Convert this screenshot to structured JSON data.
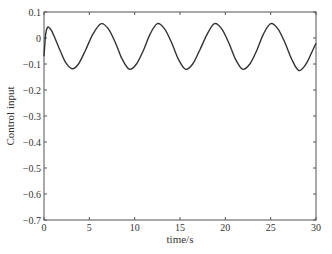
{
  "chart_data": {
    "type": "line",
    "title": "",
    "xlabel": "time/s",
    "ylabel": "Control input",
    "xlim": [
      0,
      30
    ],
    "ylim": [
      -0.7,
      0.1
    ],
    "xticks": [
      0,
      5,
      10,
      15,
      20,
      25,
      30
    ],
    "yticks": [
      0.1,
      0,
      -0.1,
      -0.2,
      -0.3,
      -0.4,
      -0.5,
      -0.6,
      -0.7
    ],
    "xtick_labels": [
      "0",
      "5",
      "10",
      "15",
      "20",
      "25",
      "30"
    ],
    "ytick_labels": [
      "0.1",
      "0",
      "-0.1",
      "-0.2",
      "-0.3",
      "-0.4",
      "-0.5",
      "-0.6",
      "-0.7"
    ],
    "grid": false,
    "legend": null,
    "series": [
      {
        "name": "Control input",
        "color": "#333333",
        "x": [
          0,
          0.1,
          0.2,
          0.35,
          0.5,
          0.8,
          1.2,
          1.8,
          2.4,
          3.1,
          3.8,
          4.6,
          5.4,
          6.3,
          7.1,
          7.9,
          8.6,
          9.4,
          10.2,
          11.0,
          11.7,
          12.5,
          13.3,
          14.1,
          14.8,
          15.6,
          16.4,
          17.2,
          18.0,
          18.8,
          19.6,
          20.4,
          21.1,
          21.9,
          22.7,
          23.5,
          24.2,
          25.0,
          25.8,
          26.6,
          27.3,
          28.1,
          28.9,
          29.6,
          30.0
        ],
        "y": [
          -0.07,
          -0.02,
          0.02,
          0.038,
          0.042,
          0.03,
          0.0,
          -0.05,
          -0.095,
          -0.118,
          -0.1,
          -0.045,
          0.015,
          0.055,
          0.035,
          -0.02,
          -0.08,
          -0.12,
          -0.1,
          -0.045,
          0.015,
          0.055,
          0.035,
          -0.02,
          -0.08,
          -0.12,
          -0.1,
          -0.045,
          0.015,
          0.055,
          0.035,
          -0.02,
          -0.08,
          -0.12,
          -0.1,
          -0.045,
          0.015,
          0.055,
          0.035,
          -0.02,
          -0.08,
          -0.125,
          -0.1,
          -0.05,
          -0.02
        ]
      }
    ]
  }
}
